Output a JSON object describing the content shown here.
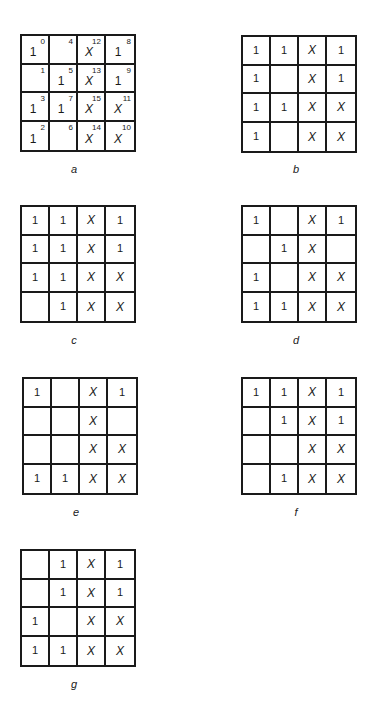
{
  "figure": {
    "panels": [
      {
        "id": "a",
        "caption": "a",
        "indexed": true,
        "pos": {
          "grid_left": 20,
          "grid_top": 34,
          "caption_left": 64,
          "caption_top": 163
        },
        "cells": [
          [
            {
              "v": "1",
              "i": "0"
            },
            {
              "v": "",
              "i": "4"
            },
            {
              "v": "X",
              "i": "12"
            },
            {
              "v": "1",
              "i": "8"
            }
          ],
          [
            {
              "v": "",
              "i": "1"
            },
            {
              "v": "1",
              "i": "5"
            },
            {
              "v": "X",
              "i": "13"
            },
            {
              "v": "1",
              "i": "9"
            }
          ],
          [
            {
              "v": "1",
              "i": "3"
            },
            {
              "v": "1",
              "i": "7"
            },
            {
              "v": "X",
              "i": "15"
            },
            {
              "v": "X",
              "i": "11"
            }
          ],
          [
            {
              "v": "1",
              "i": "2"
            },
            {
              "v": "",
              "i": "6"
            },
            {
              "v": "X",
              "i": "14"
            },
            {
              "v": "X",
              "i": "10"
            }
          ]
        ]
      },
      {
        "id": "b",
        "caption": "b",
        "indexed": false,
        "pos": {
          "grid_left": 241,
          "grid_top": 35,
          "caption_left": 286,
          "caption_top": 163
        },
        "cells": [
          [
            {
              "v": "1"
            },
            {
              "v": "1"
            },
            {
              "v": "X"
            },
            {
              "v": "1"
            }
          ],
          [
            {
              "v": "1"
            },
            {
              "v": ""
            },
            {
              "v": "X"
            },
            {
              "v": "1"
            }
          ],
          [
            {
              "v": "1"
            },
            {
              "v": "1"
            },
            {
              "v": "X"
            },
            {
              "v": "X"
            }
          ],
          [
            {
              "v": "1"
            },
            {
              "v": ""
            },
            {
              "v": "X"
            },
            {
              "v": "X"
            }
          ]
        ]
      },
      {
        "id": "c",
        "caption": "c",
        "indexed": false,
        "pos": {
          "grid_left": 20,
          "grid_top": 205,
          "caption_left": 64,
          "caption_top": 334
        },
        "cells": [
          [
            {
              "v": "1"
            },
            {
              "v": "1"
            },
            {
              "v": "X"
            },
            {
              "v": "1"
            }
          ],
          [
            {
              "v": "1"
            },
            {
              "v": "1"
            },
            {
              "v": "X"
            },
            {
              "v": "1"
            }
          ],
          [
            {
              "v": "1"
            },
            {
              "v": "1"
            },
            {
              "v": "X"
            },
            {
              "v": "X"
            }
          ],
          [
            {
              "v": ""
            },
            {
              "v": "1"
            },
            {
              "v": "X"
            },
            {
              "v": "X"
            }
          ]
        ]
      },
      {
        "id": "d",
        "caption": "d",
        "indexed": false,
        "pos": {
          "grid_left": 241,
          "grid_top": 205,
          "caption_left": 286,
          "caption_top": 334
        },
        "cells": [
          [
            {
              "v": "1"
            },
            {
              "v": ""
            },
            {
              "v": "X"
            },
            {
              "v": "1"
            }
          ],
          [
            {
              "v": ""
            },
            {
              "v": "1"
            },
            {
              "v": "X"
            },
            {
              "v": ""
            }
          ],
          [
            {
              "v": "1"
            },
            {
              "v": ""
            },
            {
              "v": "X"
            },
            {
              "v": "X"
            }
          ],
          [
            {
              "v": "1"
            },
            {
              "v": "1"
            },
            {
              "v": "X"
            },
            {
              "v": "X"
            }
          ]
        ]
      },
      {
        "id": "e",
        "caption": "e",
        "indexed": false,
        "pos": {
          "grid_left": 22,
          "grid_top": 377,
          "caption_left": 66,
          "caption_top": 506
        },
        "cells": [
          [
            {
              "v": "1"
            },
            {
              "v": ""
            },
            {
              "v": "X"
            },
            {
              "v": "1"
            }
          ],
          [
            {
              "v": ""
            },
            {
              "v": ""
            },
            {
              "v": "X"
            },
            {
              "v": ""
            }
          ],
          [
            {
              "v": ""
            },
            {
              "v": ""
            },
            {
              "v": "X"
            },
            {
              "v": "X"
            }
          ],
          [
            {
              "v": "1"
            },
            {
              "v": "1"
            },
            {
              "v": "X"
            },
            {
              "v": "X"
            }
          ]
        ]
      },
      {
        "id": "f",
        "caption": "f",
        "indexed": false,
        "pos": {
          "grid_left": 241,
          "grid_top": 377,
          "caption_left": 286,
          "caption_top": 506
        },
        "cells": [
          [
            {
              "v": "1"
            },
            {
              "v": "1"
            },
            {
              "v": "X"
            },
            {
              "v": "1"
            }
          ],
          [
            {
              "v": ""
            },
            {
              "v": "1"
            },
            {
              "v": "X"
            },
            {
              "v": "1"
            }
          ],
          [
            {
              "v": ""
            },
            {
              "v": ""
            },
            {
              "v": "X"
            },
            {
              "v": "X"
            }
          ],
          [
            {
              "v": ""
            },
            {
              "v": "1"
            },
            {
              "v": "X"
            },
            {
              "v": "X"
            }
          ]
        ]
      },
      {
        "id": "g",
        "caption": "g",
        "indexed": false,
        "pos": {
          "grid_left": 20,
          "grid_top": 549,
          "caption_left": 64,
          "caption_top": 678
        },
        "cells": [
          [
            {
              "v": ""
            },
            {
              "v": "1"
            },
            {
              "v": "X"
            },
            {
              "v": "1"
            }
          ],
          [
            {
              "v": ""
            },
            {
              "v": "1"
            },
            {
              "v": "X"
            },
            {
              "v": "1"
            }
          ],
          [
            {
              "v": "1"
            },
            {
              "v": ""
            },
            {
              "v": "X"
            },
            {
              "v": "X"
            }
          ],
          [
            {
              "v": "1"
            },
            {
              "v": "1"
            },
            {
              "v": "X"
            },
            {
              "v": "X"
            }
          ]
        ]
      }
    ],
    "colors": {
      "line": "#1a1a1a",
      "background": "#ffffff",
      "text": "#1a1a1a"
    }
  }
}
